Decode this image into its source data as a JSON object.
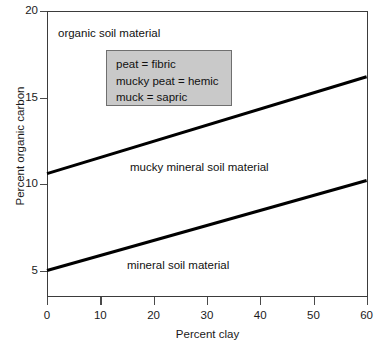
{
  "chart_data": {
    "type": "line",
    "title": "",
    "xlabel": "Percent clay",
    "ylabel": "Percent organic carbon",
    "xlim": [
      0,
      60
    ],
    "ylim": [
      4.0,
      20
    ],
    "xticks": [
      0,
      10,
      20,
      30,
      40,
      50,
      60
    ],
    "yticks": [
      5,
      10,
      15,
      20
    ],
    "grid": false,
    "legend_position": "inside-upper-center",
    "series": [
      {
        "name": "organic / mucky mineral boundary",
        "x": [
          0,
          60
        ],
        "values": [
          10.6,
          16.2
        ]
      },
      {
        "name": "mucky mineral / mineral boundary",
        "x": [
          0,
          60
        ],
        "values": [
          5.0,
          10.2
        ]
      }
    ],
    "annotations": [
      {
        "text": "organic soil material",
        "x": 11,
        "y": 18.7
      },
      {
        "text": "mucky mineral soil material",
        "x": 26,
        "y": 11.3
      },
      {
        "text": "mineral soil material",
        "x": 25,
        "y": 5.7
      }
    ],
    "legend_entries": [
      "peat = fibric",
      "mucky peat = hemic",
      "muck = sapric"
    ]
  },
  "axis": {
    "x": {
      "label": "Percent clay",
      "tick_labels": [
        "0",
        "10",
        "20",
        "30",
        "40",
        "50",
        "60"
      ]
    },
    "y": {
      "label": "Percent organic carbon",
      "tick_labels": [
        "20",
        "15",
        "10",
        "5"
      ]
    }
  },
  "legend": {
    "lines": [
      "peat = fibric",
      "mucky peat = hemic",
      "muck = sapric"
    ],
    "background_color": "#c9c9c9",
    "border_color": "#6f6f6f"
  },
  "annotations": {
    "organic": "organic soil material",
    "mucky_mineral": "mucky mineral soil material",
    "mineral": "mineral soil material"
  },
  "colors": {
    "line": "#000000",
    "axis": "#3b3b3b",
    "text": "#111111",
    "background": "#ffffff"
  }
}
